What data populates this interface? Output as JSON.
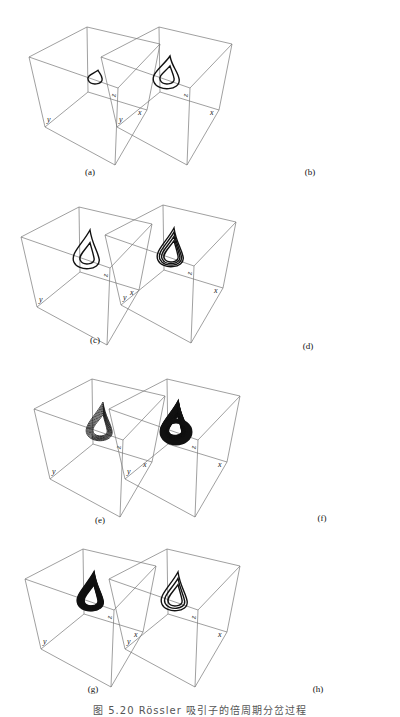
{
  "figure": {
    "caption": "图 5.20  Rössler 吸引子的倍周期分岔过程",
    "axis_labels": {
      "x": "x",
      "y": "y",
      "z": "z"
    },
    "panels": [
      {
        "id": "a",
        "label": "(a)",
        "loops": 1,
        "density": "period-1"
      },
      {
        "id": "b",
        "label": "(b)",
        "loops": 2,
        "density": "period-2"
      },
      {
        "id": "c",
        "label": "(c)",
        "loops": 2,
        "density": "period-2 (extended)"
      },
      {
        "id": "d",
        "label": "(d)",
        "loops": 4,
        "density": "period-4"
      },
      {
        "id": "e",
        "label": "(e)",
        "loops": 8,
        "density": "period-8"
      },
      {
        "id": "f",
        "label": "(f)",
        "loops": 30,
        "density": "chaotic (dense)"
      },
      {
        "id": "g",
        "label": "(g)",
        "loops": 14,
        "density": "chaotic band"
      },
      {
        "id": "h",
        "label": "(h)",
        "loops": 3,
        "density": "spiral"
      }
    ]
  },
  "colors": {
    "box": "#777777",
    "curve": "#111111",
    "background": "#ffffff"
  }
}
